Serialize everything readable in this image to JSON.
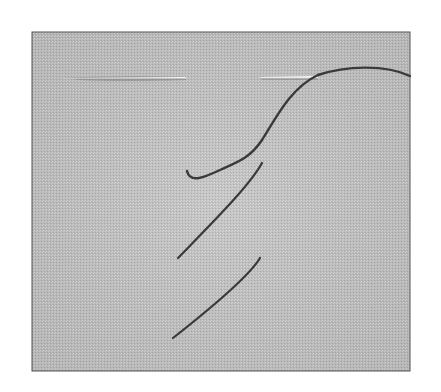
{
  "scene": {
    "description": "Photograph of woven fabric swatch with two sewing needles and dark thread forming diagonal stitches",
    "colors": {
      "background": "#ffffff",
      "fabric": "#bdbdbd",
      "fabric_light": "#cfcfcf",
      "fabric_dark": "#a8a8a8",
      "border": "#555555",
      "thread": "#3a3a3a",
      "needle": "#eeeeee",
      "needle_shadow": "#8a8a8a"
    },
    "fabric": {
      "x": 32,
      "y": 32,
      "width": 378,
      "height": 339
    },
    "needles": [
      {
        "x1": 62,
        "y1": 78,
        "x2": 186,
        "y2": 78
      },
      {
        "x1": 260,
        "y1": 77,
        "x2": 318,
        "y2": 77
      }
    ],
    "stitches": [
      {
        "d": "M318 75 C 345 66, 385 64, 410 76"
      },
      {
        "d": "M318 75 C 290 88, 275 120, 262 140 C 250 158, 238 162, 220 170 C 205 177, 190 184, 187 171"
      },
      {
        "d": "M262 163 C 250 185, 215 220, 178 258"
      },
      {
        "d": "M260 258 C 250 275, 215 305, 173 338"
      }
    ]
  }
}
